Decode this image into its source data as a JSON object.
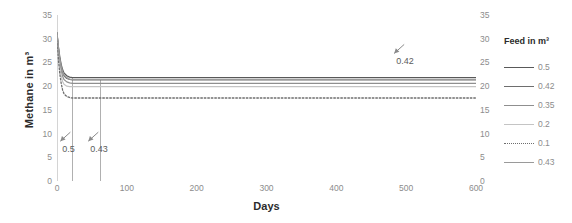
{
  "chart_data": {
    "type": "line",
    "title": "",
    "xlabel": "Days",
    "ylabel": "Methane in m³",
    "xlim": [
      0,
      600
    ],
    "ylim": [
      0,
      35
    ],
    "grid": false,
    "legend_position": "right",
    "legend_title": "Feed in m³",
    "x_ticks": [
      0,
      100,
      200,
      300,
      400,
      500,
      600
    ],
    "y_ticks": [
      0,
      5,
      10,
      15,
      20,
      25,
      30,
      35
    ],
    "y_ticks_right": [
      0,
      5,
      10,
      15,
      20,
      25,
      30,
      35
    ],
    "series": [
      {
        "name": "0.5",
        "color": "#595959",
        "style": "solid",
        "x": [
          0,
          2,
          4,
          6,
          8,
          10,
          14,
          18,
          22,
          30,
          45,
          62,
          90,
          150,
          250,
          350,
          450,
          550,
          600
        ],
        "values": [
          31.2,
          28.4,
          26.2,
          24.6,
          23.5,
          22.8,
          22.2,
          21.9,
          21.8,
          21.8,
          21.8,
          21.8,
          21.8,
          21.8,
          21.8,
          21.8,
          21.8,
          21.8,
          21.8
        ]
      },
      {
        "name": "0.42",
        "color": "#6e6e6e",
        "style": "solid",
        "x": [
          0,
          2,
          4,
          6,
          8,
          10,
          14,
          18,
          22,
          30,
          45,
          62,
          90,
          150,
          250,
          350,
          450,
          550,
          600
        ],
        "values": [
          31.2,
          28.0,
          25.6,
          24.0,
          22.9,
          22.2,
          21.6,
          21.4,
          21.3,
          21.3,
          21.3,
          21.3,
          21.3,
          21.3,
          21.3,
          21.3,
          21.3,
          21.3,
          21.3
        ]
      },
      {
        "name": "0.35",
        "color": "#8f8f8f",
        "style": "solid",
        "x": [
          0,
          2,
          4,
          6,
          8,
          10,
          14,
          18,
          22,
          30,
          45,
          62,
          90,
          150,
          250,
          350,
          450,
          550,
          600
        ],
        "values": [
          31.2,
          27.4,
          25.0,
          23.2,
          22.1,
          21.4,
          20.9,
          20.7,
          20.6,
          20.6,
          20.6,
          20.6,
          20.6,
          20.6,
          20.6,
          20.6,
          20.6,
          20.6,
          20.6
        ]
      },
      {
        "name": "0.2",
        "color": "#c4c4c4",
        "style": "solid",
        "x": [
          0,
          2,
          4,
          6,
          8,
          10,
          14,
          18,
          22,
          30,
          45,
          62,
          90,
          150,
          250,
          350,
          450,
          550,
          600
        ],
        "values": [
          31.2,
          26.6,
          24.0,
          22.2,
          21.0,
          20.4,
          20.0,
          19.9,
          19.9,
          19.9,
          19.9,
          19.9,
          19.9,
          19.9,
          19.9,
          19.9,
          19.9,
          19.9,
          19.9
        ]
      },
      {
        "name": "0.1",
        "color": "#6e6e6e",
        "style": "dotted",
        "x": [
          0,
          2,
          4,
          6,
          8,
          10,
          14,
          18,
          22,
          30,
          45,
          62,
          90,
          150,
          250,
          350,
          450,
          550,
          600
        ],
        "values": [
          31.2,
          25.6,
          22.6,
          20.6,
          19.2,
          18.4,
          17.8,
          17.6,
          17.5,
          17.5,
          17.5,
          17.5,
          17.5,
          17.5,
          17.5,
          17.5,
          17.5,
          17.5,
          17.5
        ]
      },
      {
        "name": "0.43",
        "color": "#9a9a9a",
        "style": "solid",
        "x": [
          0,
          2,
          4,
          6,
          8,
          10,
          14,
          18,
          22,
          30,
          45,
          62,
          90,
          150,
          250,
          350,
          450,
          550,
          600
        ],
        "values": [
          31.2,
          28.2,
          25.8,
          24.2,
          23.1,
          22.4,
          21.8,
          21.5,
          21.4,
          21.4,
          21.4,
          21.4,
          21.4,
          21.4,
          21.4,
          21.4,
          21.4,
          21.4,
          21.4
        ]
      }
    ],
    "drop_lines": [
      {
        "x": 22,
        "y_top": 21.9,
        "label": "0.5"
      },
      {
        "x": 62,
        "y_top": 21.4,
        "label": "0.43"
      }
    ],
    "annotations": [
      {
        "label": "0.5",
        "x": 22,
        "y": 6.5
      },
      {
        "label": "0.43",
        "x": 62,
        "y": 6.5
      },
      {
        "label": "0.42",
        "x": 500,
        "y": 25.0
      }
    ],
    "legend_entries": [
      {
        "label": "0.5",
        "color": "#595959",
        "style": "solid"
      },
      {
        "label": "0.42",
        "color": "#6e6e6e",
        "style": "solid"
      },
      {
        "label": "0.35",
        "color": "#8f8f8f",
        "style": "solid"
      },
      {
        "label": "0.2",
        "color": "#c4c4c4",
        "style": "solid"
      },
      {
        "label": "0.1",
        "color": "#6e6e6e",
        "style": "dotted"
      },
      {
        "label": "0.43",
        "color": "#9a9a9a",
        "style": "solid"
      }
    ]
  }
}
